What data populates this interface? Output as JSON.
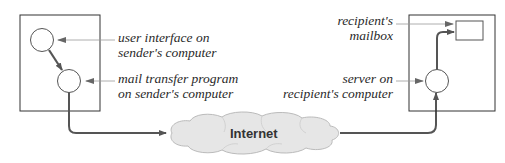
{
  "diagram": {
    "sender": {
      "ui_label": [
        "user interface on",
        "sender's computer"
      ],
      "mta_label": [
        "mail transfer program",
        "on sender's computer"
      ]
    },
    "network": {
      "label": "Internet"
    },
    "recipient": {
      "mailbox_label": [
        "recipient's",
        "mailbox"
      ],
      "server_label": [
        "server on",
        "recipient's computer"
      ]
    },
    "colors": {
      "line": "#555555",
      "pointer": "#888888",
      "cloud_fill": "#e6e6e6",
      "cloud_stroke": "#bbbbbb",
      "box_stroke": "#333333"
    }
  }
}
